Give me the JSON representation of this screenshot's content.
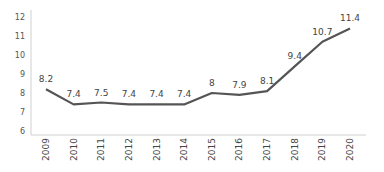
{
  "chart_data": {
    "type": "line",
    "title": "",
    "xlabel": "",
    "ylabel": "",
    "categories": [
      "2009",
      "2010",
      "2011",
      "2012",
      "2013",
      "2014",
      "2015",
      "2016",
      "2017",
      "2018",
      "2019",
      "2020"
    ],
    "series": [
      {
        "name": "",
        "values": [
          8.2,
          7.4,
          7.5,
          7.4,
          7.4,
          7.4,
          8,
          7.9,
          8.1,
          9.4,
          10.7,
          11.4
        ]
      }
    ],
    "data_labels": [
      "8.2",
      "7.4",
      "7.5",
      "7.4",
      "7.4",
      "7.4",
      "8",
      "7.9",
      "8.1",
      "9.4",
      "10.7",
      "11.4"
    ],
    "yticks": [
      6,
      7,
      8,
      9,
      10,
      11,
      12
    ],
    "ylim": [
      6,
      12
    ],
    "grid": false,
    "legend": "none",
    "colors": {
      "line": "#555555",
      "axis": "#d0d0d0",
      "text": "#444444"
    }
  }
}
